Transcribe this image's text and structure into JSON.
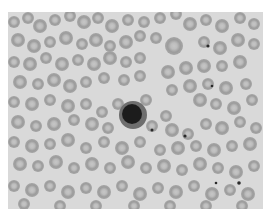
{
  "image": {
    "description": "Grayscale micrograph of a peripheral blood smear showing many red blood cells and one dark-staining nucleated cell near the center",
    "colors": {
      "page_background": "#ffffff",
      "smear_background": "#d9d9d9",
      "cell_rim": "#9a9a9a",
      "cell_center": "#c4c4c4",
      "dark_cell_nucleus": "#1e1e1e",
      "dark_cell_cytoplasm": "#6e6e6e",
      "platelet": "#2a2a2a"
    },
    "frame": {
      "x": 8,
      "y": 12,
      "width": 255,
      "height": 197
    },
    "red_cells": [
      [
        14,
        22,
        6
      ],
      [
        28,
        18,
        6
      ],
      [
        40,
        26,
        7
      ],
      [
        55,
        20,
        6
      ],
      [
        70,
        16,
        6
      ],
      [
        84,
        22,
        7
      ],
      [
        98,
        18,
        6
      ],
      [
        112,
        26,
        7
      ],
      [
        128,
        20,
        6
      ],
      [
        144,
        22,
        6
      ],
      [
        160,
        18,
        6
      ],
      [
        176,
        14,
        6
      ],
      [
        190,
        24,
        7
      ],
      [
        206,
        20,
        6
      ],
      [
        222,
        26,
        7
      ],
      [
        240,
        18,
        6
      ],
      [
        254,
        24,
        6
      ],
      [
        18,
        40,
        7
      ],
      [
        34,
        46,
        7
      ],
      [
        50,
        42,
        6
      ],
      [
        66,
        38,
        7
      ],
      [
        82,
        44,
        6
      ],
      [
        96,
        40,
        7
      ],
      [
        110,
        46,
        6
      ],
      [
        126,
        42,
        7
      ],
      [
        140,
        36,
        6
      ],
      [
        156,
        38,
        6
      ],
      [
        174,
        46,
        9
      ],
      [
        204,
        42,
        6
      ],
      [
        220,
        48,
        7
      ],
      [
        238,
        40,
        7
      ],
      [
        254,
        44,
        6
      ],
      [
        14,
        62,
        6
      ],
      [
        30,
        64,
        7
      ],
      [
        46,
        58,
        6
      ],
      [
        62,
        64,
        7
      ],
      [
        78,
        60,
        6
      ],
      [
        94,
        64,
        7
      ],
      [
        110,
        58,
        7
      ],
      [
        126,
        62,
        6
      ],
      [
        140,
        58,
        6
      ],
      [
        168,
        72,
        7
      ],
      [
        186,
        68,
        7
      ],
      [
        204,
        66,
        7
      ],
      [
        222,
        66,
        6
      ],
      [
        240,
        62,
        7
      ],
      [
        20,
        82,
        7
      ],
      [
        38,
        84,
        6
      ],
      [
        54,
        80,
        7
      ],
      [
        70,
        86,
        7
      ],
      [
        86,
        82,
        6
      ],
      [
        104,
        78,
        6
      ],
      [
        124,
        80,
        6
      ],
      [
        140,
        76,
        6
      ],
      [
        172,
        90,
        6
      ],
      [
        190,
        86,
        7
      ],
      [
        208,
        84,
        6
      ],
      [
        226,
        88,
        7
      ],
      [
        246,
        84,
        6
      ],
      [
        14,
        102,
        6
      ],
      [
        32,
        104,
        7
      ],
      [
        50,
        100,
        6
      ],
      [
        68,
        106,
        7
      ],
      [
        86,
        104,
        6
      ],
      [
        102,
        112,
        6
      ],
      [
        118,
        104,
        6
      ],
      [
        146,
        100,
        6
      ],
      [
        166,
        116,
        6
      ],
      [
        200,
        100,
        7
      ],
      [
        216,
        104,
        6
      ],
      [
        234,
        108,
        7
      ],
      [
        252,
        100,
        6
      ],
      [
        18,
        122,
        7
      ],
      [
        36,
        126,
        6
      ],
      [
        54,
        124,
        7
      ],
      [
        74,
        120,
        6
      ],
      [
        92,
        124,
        7
      ],
      [
        108,
        128,
        6
      ],
      [
        152,
        126,
        6
      ],
      [
        172,
        130,
        7
      ],
      [
        188,
        134,
        6
      ],
      [
        206,
        124,
        6
      ],
      [
        222,
        128,
        7
      ],
      [
        240,
        122,
        6
      ],
      [
        256,
        128,
        6
      ],
      [
        14,
        142,
        6
      ],
      [
        32,
        146,
        7
      ],
      [
        50,
        144,
        6
      ],
      [
        68,
        140,
        7
      ],
      [
        86,
        148,
        6
      ],
      [
        104,
        142,
        6
      ],
      [
        122,
        148,
        7
      ],
      [
        140,
        142,
        6
      ],
      [
        160,
        150,
        6
      ],
      [
        178,
        148,
        7
      ],
      [
        196,
        146,
        6
      ],
      [
        214,
        150,
        7
      ],
      [
        232,
        146,
        6
      ],
      [
        250,
        144,
        7
      ],
      [
        20,
        164,
        7
      ],
      [
        38,
        166,
        6
      ],
      [
        56,
        162,
        7
      ],
      [
        74,
        168,
        6
      ],
      [
        92,
        164,
        7
      ],
      [
        110,
        168,
        6
      ],
      [
        128,
        162,
        7
      ],
      [
        146,
        168,
        6
      ],
      [
        164,
        166,
        7
      ],
      [
        182,
        170,
        6
      ],
      [
        200,
        164,
        7
      ],
      [
        218,
        168,
        6
      ],
      [
        236,
        172,
        7
      ],
      [
        254,
        166,
        6
      ],
      [
        14,
        186,
        6
      ],
      [
        32,
        190,
        7
      ],
      [
        50,
        186,
        6
      ],
      [
        68,
        192,
        7
      ],
      [
        86,
        188,
        6
      ],
      [
        104,
        192,
        7
      ],
      [
        122,
        186,
        6
      ],
      [
        140,
        194,
        7
      ],
      [
        158,
        188,
        6
      ],
      [
        176,
        192,
        7
      ],
      [
        194,
        186,
        6
      ],
      [
        212,
        194,
        7
      ],
      [
        230,
        190,
        6
      ],
      [
        248,
        194,
        7
      ],
      [
        24,
        204,
        6
      ],
      [
        60,
        206,
        6
      ],
      [
        96,
        206,
        6
      ],
      [
        134,
        206,
        6
      ],
      [
        170,
        206,
        6
      ],
      [
        206,
        206,
        6
      ],
      [
        242,
        206,
        6
      ]
    ],
    "dark_cell": {
      "cx": 133,
      "cy": 115,
      "r_outer": 14,
      "r_nucleus": 10
    },
    "platelets": [
      [
        208,
        46,
        1.6
      ],
      [
        212,
        86,
        1.3
      ],
      [
        152,
        130,
        1.5
      ],
      [
        185,
        136,
        1.6
      ],
      [
        239,
        183,
        1.8
      ],
      [
        216,
        183,
        1.3
      ]
    ]
  }
}
